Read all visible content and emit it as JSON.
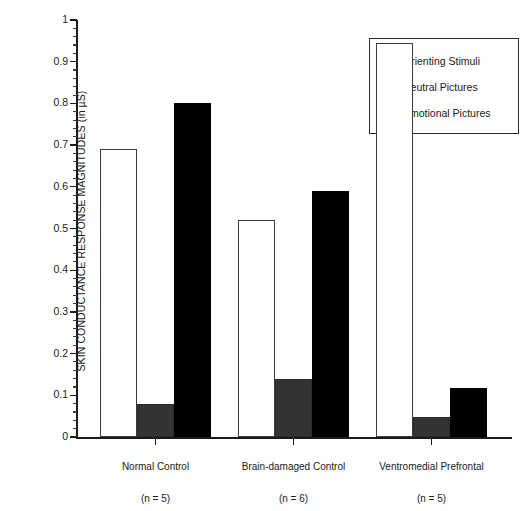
{
  "chart_data": {
    "type": "bar",
    "title": "",
    "xlabel": "",
    "ylabel": "SKIN CONDUCTANCE RESPONSE MAGNITUDES (in µS)",
    "ylim": [
      0,
      1
    ],
    "ytick_labels": [
      "0",
      "0.1",
      "0.2",
      "0.3",
      "0.4",
      "0.5",
      "0.6",
      "0.7",
      "0.8",
      "0.9",
      "1"
    ],
    "ytick_values": [
      0,
      0.1,
      0.2,
      0.3,
      0.4,
      0.5,
      0.6,
      0.7,
      0.8,
      0.9,
      1
    ],
    "minor_tick_step": 0.02,
    "grid": false,
    "legend_position": "top-right",
    "categories": [
      "Normal Control",
      "Brain-damaged Control",
      "Ventromedial Prefrontal"
    ],
    "category_subscripts": [
      "(n = 5)",
      "(n = 6)",
      "(n = 5)"
    ],
    "series": [
      {
        "name": "Orienting Stimuli",
        "color": "#ffffff",
        "values": [
          0.69,
          0.52,
          0.945
        ]
      },
      {
        "name": "Neutral Pictures",
        "color": "#333333",
        "values": [
          0.08,
          0.14,
          0.048
        ]
      },
      {
        "name": "Emotional Pictures",
        "color": "#000000",
        "values": [
          0.8,
          0.59,
          0.117
        ]
      }
    ]
  },
  "legend": {
    "items": [
      {
        "label": "Orienting Stimuli",
        "swatch": "orienting"
      },
      {
        "label": "Neutral Pictures",
        "swatch": "neutral"
      },
      {
        "label": "Emotional Pictures",
        "swatch": "emotional"
      }
    ]
  }
}
